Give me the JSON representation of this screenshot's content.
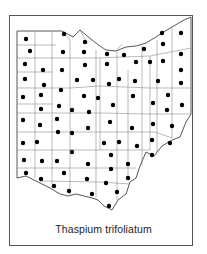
{
  "map": {
    "title": "Thaspium trifoliatum",
    "region": "Ohio",
    "subdivision": "counties",
    "marker_color": "#000000",
    "line_color": "#555555",
    "dots": [
      [
        26,
        39
      ],
      [
        64,
        34
      ],
      [
        85,
        42
      ],
      [
        162,
        33
      ],
      [
        181,
        33
      ],
      [
        30,
        51
      ],
      [
        63,
        52
      ],
      [
        84,
        52
      ],
      [
        107,
        54
      ],
      [
        124,
        55
      ],
      [
        144,
        49
      ],
      [
        163,
        44
      ],
      [
        25,
        64
      ],
      [
        85,
        65
      ],
      [
        107,
        64
      ],
      [
        136,
        62
      ],
      [
        150,
        62
      ],
      [
        163,
        61
      ],
      [
        181,
        54
      ],
      [
        43,
        70
      ],
      [
        62,
        70
      ],
      [
        181,
        70
      ],
      [
        25,
        79
      ],
      [
        77,
        80
      ],
      [
        93,
        80
      ],
      [
        109,
        84
      ],
      [
        119,
        79
      ],
      [
        135,
        81
      ],
      [
        158,
        81
      ],
      [
        181,
        83
      ],
      [
        44,
        85
      ],
      [
        61,
        90
      ],
      [
        23,
        97
      ],
      [
        41,
        95
      ],
      [
        84,
        96
      ],
      [
        98,
        98
      ],
      [
        133,
        96
      ],
      [
        168,
        95
      ],
      [
        59,
        106
      ],
      [
        72,
        110
      ],
      [
        89,
        112
      ],
      [
        113,
        105
      ],
      [
        153,
        103
      ],
      [
        182,
        105
      ],
      [
        41,
        109
      ],
      [
        167,
        110
      ],
      [
        23,
        120
      ],
      [
        40,
        125
      ],
      [
        57,
        119
      ],
      [
        88,
        128
      ],
      [
        110,
        122
      ],
      [
        153,
        124
      ],
      [
        172,
        126
      ],
      [
        58,
        132
      ],
      [
        72,
        133
      ],
      [
        132,
        128
      ],
      [
        23,
        143
      ],
      [
        37,
        142
      ],
      [
        104,
        143
      ],
      [
        119,
        142
      ],
      [
        137,
        146
      ],
      [
        152,
        140
      ],
      [
        170,
        143
      ],
      [
        72,
        152
      ],
      [
        111,
        155
      ],
      [
        152,
        155
      ],
      [
        24,
        160
      ],
      [
        42,
        161
      ],
      [
        57,
        161
      ],
      [
        88,
        164
      ],
      [
        128,
        164
      ],
      [
        26,
        173
      ],
      [
        64,
        173
      ],
      [
        111,
        169
      ],
      [
        41,
        179
      ],
      [
        87,
        179
      ],
      [
        106,
        183
      ],
      [
        128,
        178
      ],
      [
        54,
        186
      ],
      [
        69,
        191
      ],
      [
        92,
        194
      ],
      [
        117,
        192
      ],
      [
        109,
        206
      ]
    ]
  }
}
